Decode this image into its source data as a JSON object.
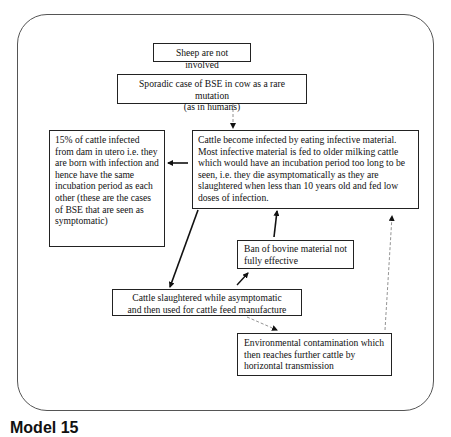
{
  "diagram": {
    "boxes": {
      "sheep": "Sheep are not involved",
      "sporadic_line1": "Sporadic case of BSE in cow as a rare mutation",
      "sporadic_line2": "(as in humans)",
      "in_utero": "15% of cattle infected from dam in utero i.e. they are born with infection and hence have the same incubation period as each other (these are the cases of BSE that are seen as symptomatic)",
      "infected_feed": "Cattle become infected by eating infective material. Most infective material is fed to older milking cattle which would have an incubation period too long to be seen, i.e. they die asymptomatically as they are slaughtered when less than 10 years old and fed low doses of infection.",
      "ban": "Ban of bovine material not fully effective",
      "slaughtered_line1": "Cattle slaughtered while asymptomatic",
      "slaughtered_line2": "and then used for cattle feed manufacture",
      "environmental": "Environmental contamination which then reaches further cattle by horizontal transmission"
    },
    "arrows": [
      {
        "from": "sporadic",
        "to": "infected_feed",
        "style": "dashed"
      },
      {
        "from": "infected_feed",
        "to": "in_utero",
        "style": "solid"
      },
      {
        "from": "infected_feed",
        "to": "slaughtered",
        "style": "solid"
      },
      {
        "from": "slaughtered",
        "to": "ban",
        "style": "solid"
      },
      {
        "from": "ban",
        "to": "infected_feed",
        "style": "solid"
      },
      {
        "from": "slaughtered",
        "to": "environmental",
        "style": "dashed"
      },
      {
        "from": "environmental",
        "to": "infected_feed",
        "style": "dashed"
      }
    ],
    "caption": "Model 15"
  }
}
